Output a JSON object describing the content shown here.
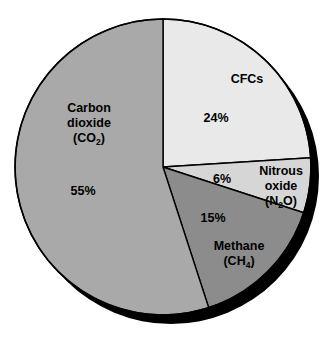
{
  "chart_data": {
    "type": "pie",
    "title": "",
    "subtitle": "",
    "xlabel": "",
    "ylabel": "",
    "legend_position": "none",
    "grid": false,
    "total": 100,
    "units": "%",
    "start_angle_deg": 0,
    "direction": "clockwise",
    "categories": [
      "CFCs",
      "Nitrous oxide (N2O)",
      "Methane (CH4)",
      "Carbon dioxide (CO2)"
    ],
    "values": [
      24,
      6,
      15,
      55
    ],
    "slices": [
      {
        "key": "cfcs",
        "name": "CFCs",
        "name_main": "CFCs",
        "name_line2": "",
        "formula_pre": "",
        "formula_sub": "",
        "formula_post": "",
        "value": 24,
        "value_label": "24%",
        "color": "#e9e9e9",
        "start_deg": 0,
        "end_deg": 86.4
      },
      {
        "key": "nitrous-oxide",
        "name": "Nitrous oxide (N2O)",
        "name_main": "Nitrous",
        "name_line2": "oxide",
        "formula_pre": "(N",
        "formula_sub": "2",
        "formula_post": "O)",
        "value": 6,
        "value_label": "6%",
        "color": "#d6d6d6",
        "start_deg": 86.4,
        "end_deg": 108.0
      },
      {
        "key": "methane",
        "name": "Methane (CH4)",
        "name_main": "Methane",
        "name_line2": "",
        "formula_pre": "(CH",
        "formula_sub": "4",
        "formula_post": ")",
        "value": 15,
        "value_label": "15%",
        "color": "#8c8c8c",
        "start_deg": 108.0,
        "end_deg": 162.0
      },
      {
        "key": "carbon-dioxide",
        "name": "Carbon dioxide (CO2)",
        "name_main": "Carbon",
        "name_line2": "dioxide",
        "formula_pre": "(CO",
        "formula_sub": "2",
        "formula_post": ")",
        "value": 55,
        "value_label": "55%",
        "color": "#a9a9a9",
        "start_deg": 162.0,
        "end_deg": 360.0
      }
    ]
  },
  "colors": {
    "background": "#ffffff",
    "outline": "#000000",
    "shadow": "#000000",
    "text": "#000000"
  }
}
